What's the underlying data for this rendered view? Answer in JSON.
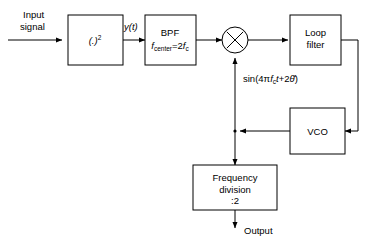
{
  "diagram": {
    "blocks": {
      "squarer": {
        "label": "(.)",
        "exponent": "2"
      },
      "bpf": {
        "label": "BPF",
        "param_name": "f",
        "param_sub": "center",
        "param_eq": "=2",
        "param_f": "f",
        "param_fsub": "c"
      },
      "loop_filter": {
        "line1": "Loop",
        "line2": "filter"
      },
      "vco": {
        "label": "VCO"
      },
      "freq_div": {
        "line1": "Frequency",
        "line2": "division",
        "line3": ":2"
      }
    },
    "labels": {
      "input_line1": "Input",
      "input_line2": "signal",
      "y_of_t": "y(t)",
      "vco_signal_pre": "sin(4",
      "vco_signal_pi": "π",
      "vco_signal_f": "f",
      "vco_signal_fsub": "c",
      "vco_signal_t": "t",
      "vco_signal_plus": "+2",
      "vco_signal_theta": "θ̂",
      "vco_signal_close": ")",
      "output": "Output"
    },
    "colors": {
      "stroke": "#000000",
      "fill": "#ffffff",
      "background": "#ffffff"
    }
  }
}
